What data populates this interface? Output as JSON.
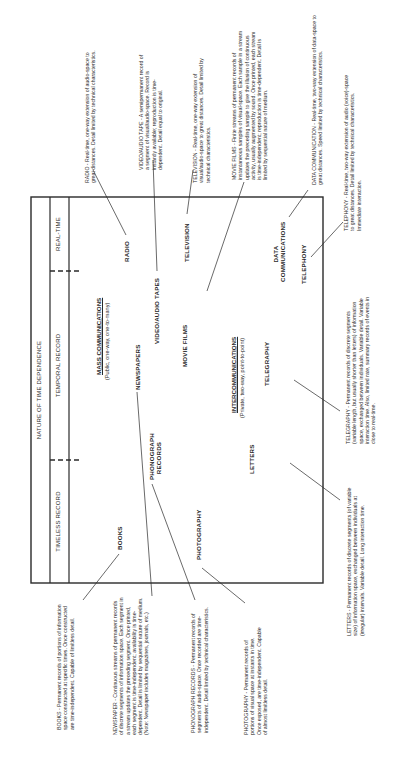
{
  "header": {
    "title": "NATURE OF TIME DEPENDENCE",
    "columns": [
      "REAL-TIME",
      "TEMPORAL RECORD",
      "TIMELESS RECORD"
    ]
  },
  "groups": {
    "mass": {
      "title": "MASS COMMUNICATIONS",
      "subtitle": "(Public, one-way, one-to-many)"
    },
    "inter": {
      "title": "INTERCOMMUNICATIONS",
      "subtitle": "(Private, two-way, point-to-point)"
    }
  },
  "media": {
    "radio": "RADIO",
    "video_audio_tapes": "VIDEO/AUDIO TAPES",
    "television": "TELEVISION",
    "data_comm_1": "DATA",
    "data_comm_2": "COMMUNICATIONS",
    "telephony": "TELEPHONY",
    "newspapers": "NEWSPAPERS",
    "phonograph_1": "PHONOGRAPH",
    "phonograph_2": "RECORDS",
    "movie_films": "MOVIE FILMS",
    "telegraphy": "TELEGRAPHY",
    "letters": "LETTERS",
    "books": "BOOKS",
    "photography": "PHOTOGRAPHY"
  },
  "descriptions": {
    "radio": "RADIO - Real-time, one-way extension of audio-space to great distances. Detail limited by technical characteristics.",
    "video_audio_tape": "VIDEO/AUDIO TAPE - A semipermanent record of a segment of visual/audio-space. Record is instantly available; reproduction is time-dependent. Detail equal to original.",
    "television": "TELEVISION - Real-time, one-way extension of visual/audio-space to great distances. Detail limited by technical characteristics.",
    "movie_films": "MOVIE FILMS - Finite streams of permanent records of instantaneous samples of visual-space. Each sample in a stream updates the preceding sample to give the illusion of continuous activity, usually augmented by sound. Once printed, each stream is time-independent; reproduction is time-dependent. Detail is limited by sequential nature of medium.",
    "data_communication": "DATA COMMUNICATION - Real-time, two-way extension of data-space to great distances. Speed limited by technical characteristics.",
    "telephony": "TELEPHONY - Real-time, two-way extension of audio (voice)-space to great distances. Detail limited by technical characteristics. Immediate interaction.",
    "books": "BOOKS - Permanent records of portions of information space constructed at specific times. Once constructed are time-independent. Capable of limitless detail.",
    "newspaper": "NEWSPAPER - Continuous streams of permanent records of discrete segments of information space. Each segment in a stream updates the preceding segment. Once printed, each segment is time-independent; availability is time-dependent. Detail is limited by sequential nature of medium. (Note: Newspaper includes magazines, journals, etc.)",
    "phonograph_records": "PHONOGRAPH RECORDS - Permanent records of segments of audio-space. Once recorded are time-independent. Detail limited by technical characteristics.",
    "photography": "PHOTOGRAPHY - Permanent records of portions of visual space at instants in time. Once exposed, are time-independent. Capable of almost limitless detail.",
    "letters": "LETTERS - Permanent records of discrete segments (of variable size) of information space, exchanged between individuals at (irregular) intervals. Variable detail. Long interaction time.",
    "telegraphy": "TELEGRAPHY - Permanent records of discrete segments (variable length, but usually shorter than letters) of information space, exchanged between individuals. Variable detail. Variable interaction time. Also, limited rate, summary records of events in close to real-time."
  },
  "colors": {
    "ink": "#2a2a2a",
    "paper": "#ffffff"
  }
}
